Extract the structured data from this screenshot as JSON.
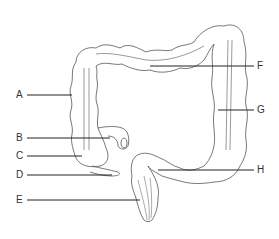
{
  "diagram": {
    "labels": [
      {
        "id": "A",
        "text": "A",
        "side": "left",
        "y": 95
      },
      {
        "id": "B",
        "text": "B",
        "side": "left",
        "y": 138
      },
      {
        "id": "C",
        "text": "C",
        "side": "left",
        "y": 156
      },
      {
        "id": "D",
        "text": "D",
        "side": "left",
        "y": 175
      },
      {
        "id": "E",
        "text": "E",
        "side": "left",
        "y": 200
      },
      {
        "id": "F",
        "text": "F",
        "side": "right",
        "y": 66
      },
      {
        "id": "G",
        "text": "G",
        "side": "right",
        "y": 110
      },
      {
        "id": "H",
        "text": "H",
        "side": "right",
        "y": 170
      }
    ],
    "colors": {
      "line": "#222222",
      "outline": "#555555",
      "background": "#ffffff"
    }
  }
}
